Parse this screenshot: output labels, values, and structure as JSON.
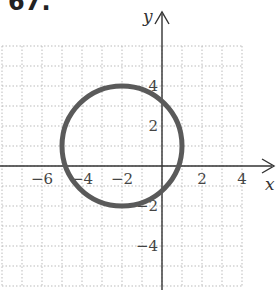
{
  "problem_number": "67.",
  "chart_data": {
    "type": "line",
    "title": "",
    "xlabel": "x",
    "ylabel": "y",
    "xlim": [
      -8,
      4
    ],
    "ylim": [
      -6,
      6
    ],
    "grid": true,
    "grid_step": 1,
    "x_ticks": [
      -6,
      -4,
      -2,
      2,
      4
    ],
    "x_tick_labels": [
      "−6",
      "−4",
      "−2",
      "2",
      "4"
    ],
    "y_ticks": [
      4,
      2,
      -2,
      -4
    ],
    "y_tick_labels": [
      "4",
      "2",
      "−2",
      "−4"
    ],
    "series": [
      {
        "name": "circle",
        "shape": "circle",
        "center": [
          -2,
          1
        ],
        "radius": 3,
        "color": "#5a5a5a"
      }
    ]
  }
}
